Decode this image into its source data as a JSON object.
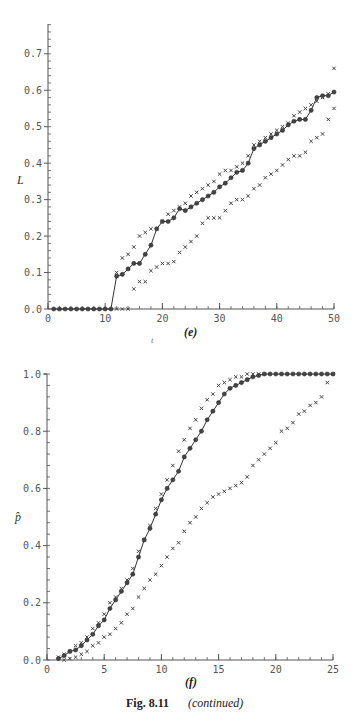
{
  "figure": {
    "label": "Fig. 8.11",
    "continued": "(continued)"
  },
  "chart_data": [
    {
      "type": "line",
      "panel": "(e)",
      "title": "",
      "xlabel": "t",
      "ylabel": "L",
      "xlim": [
        0,
        50
      ],
      "ylim": [
        0,
        0.75
      ],
      "xticks": [
        0,
        10,
        20,
        30,
        40,
        50
      ],
      "yticks": [
        0.0,
        0.1,
        0.2,
        0.3,
        0.4,
        0.5,
        0.6,
        0.7
      ],
      "ytick_labels": [
        "0.0",
        "0.1",
        "0.2",
        "0.3",
        "0.4",
        "0.5",
        "0.6",
        "0.7"
      ],
      "grid": false,
      "legend": null,
      "series": [
        {
          "name": "estimate",
          "marker": "circle",
          "line": true,
          "x": [
            1,
            2,
            3,
            4,
            5,
            6,
            7,
            8,
            9,
            10,
            11,
            12,
            13,
            14,
            15,
            16,
            17,
            18,
            19,
            20,
            21,
            22,
            23,
            24,
            25,
            26,
            27,
            28,
            29,
            30,
            31,
            32,
            33,
            34,
            35,
            36,
            37,
            38,
            39,
            40,
            41,
            42,
            43,
            44,
            45,
            46,
            47,
            48,
            49,
            50
          ],
          "y": [
            0,
            0,
            0,
            0,
            0,
            0,
            0,
            0,
            0,
            0,
            0,
            0.09,
            0.095,
            0.11,
            0.125,
            0.125,
            0.15,
            0.175,
            0.22,
            0.24,
            0.24,
            0.25,
            0.275,
            0.27,
            0.28,
            0.29,
            0.3,
            0.31,
            0.32,
            0.335,
            0.345,
            0.36,
            0.375,
            0.38,
            0.4,
            0.44,
            0.45,
            0.46,
            0.47,
            0.48,
            0.49,
            0.505,
            0.515,
            0.52,
            0.52,
            0.545,
            0.58,
            0.585,
            0.585,
            0.595
          ]
        },
        {
          "name": "upper bound",
          "marker": "x",
          "line": false,
          "x": [
            12,
            13,
            14,
            15,
            16,
            17,
            18,
            19,
            20,
            21,
            22,
            23,
            24,
            25,
            26,
            27,
            28,
            29,
            30,
            31,
            32,
            33,
            34,
            35,
            36,
            37,
            38,
            39,
            40,
            41,
            42,
            43,
            44,
            45,
            46,
            47,
            48,
            49,
            50
          ],
          "y": [
            0.1,
            0.14,
            0.15,
            0.17,
            0.2,
            0.21,
            0.22,
            0.22,
            0.24,
            0.26,
            0.27,
            0.28,
            0.29,
            0.31,
            0.32,
            0.33,
            0.34,
            0.35,
            0.37,
            0.38,
            0.38,
            0.39,
            0.4,
            0.42,
            0.45,
            0.46,
            0.47,
            0.48,
            0.49,
            0.5,
            0.51,
            0.53,
            0.54,
            0.55,
            0.56,
            0.57,
            0.58,
            0.59,
            0.66
          ]
        },
        {
          "name": "lower bound",
          "marker": "x",
          "line": false,
          "x": [
            12,
            13,
            14,
            15,
            16,
            17,
            18,
            19,
            20,
            21,
            22,
            23,
            24,
            25,
            26,
            27,
            28,
            29,
            30,
            31,
            32,
            33,
            34,
            35,
            36,
            37,
            38,
            39,
            40,
            41,
            42,
            43,
            44,
            45,
            46,
            47,
            48,
            49,
            50
          ],
          "y": [
            0,
            0,
            0,
            0.055,
            0.075,
            0.075,
            0.105,
            0.115,
            0.125,
            0.125,
            0.13,
            0.155,
            0.17,
            0.185,
            0.2,
            0.235,
            0.25,
            0.25,
            0.25,
            0.27,
            0.29,
            0.3,
            0.3,
            0.31,
            0.33,
            0.34,
            0.36,
            0.37,
            0.38,
            0.395,
            0.41,
            0.42,
            0.42,
            0.43,
            0.46,
            0.47,
            0.48,
            0.52,
            0.55
          ]
        }
      ]
    },
    {
      "type": "line",
      "panel": "(f)",
      "title": "",
      "xlabel": "",
      "ylabel": "p̂",
      "xlim": [
        0,
        25
      ],
      "ylim": [
        0,
        1.0
      ],
      "xticks": [
        0,
        5,
        10,
        15,
        20,
        25
      ],
      "yticks": [
        0.0,
        0.2,
        0.4,
        0.6,
        0.8,
        1.0
      ],
      "ytick_labels": [
        "0.0",
        "0.2",
        "0.4",
        "0.6",
        "0.8",
        "1.0"
      ],
      "grid": false,
      "legend": null,
      "series": [
        {
          "name": "estimate",
          "marker": "circle",
          "line": true,
          "x": [
            1,
            1.5,
            2,
            2.5,
            3,
            3.5,
            4,
            4.5,
            5,
            5.5,
            6,
            6.5,
            7,
            7.5,
            8,
            8.5,
            9,
            9.5,
            10,
            10.5,
            11,
            11.5,
            12,
            12.5,
            13,
            13.5,
            14,
            14.5,
            15,
            15.5,
            16,
            16.5,
            17,
            17.5,
            18,
            18.5,
            19,
            19.5,
            20,
            20.5,
            21,
            21.5,
            22,
            22.5,
            23,
            23.5,
            24,
            24.5,
            25
          ],
          "y": [
            0.005,
            0.015,
            0.03,
            0.035,
            0.05,
            0.07,
            0.09,
            0.12,
            0.14,
            0.18,
            0.21,
            0.24,
            0.27,
            0.3,
            0.36,
            0.42,
            0.46,
            0.51,
            0.56,
            0.6,
            0.63,
            0.66,
            0.71,
            0.74,
            0.77,
            0.8,
            0.84,
            0.87,
            0.9,
            0.93,
            0.95,
            0.96,
            0.97,
            0.98,
            0.99,
            0.995,
            1.0,
            1.0,
            1.0,
            1.0,
            1.0,
            1.0,
            1.0,
            1.0,
            1.0,
            1.0,
            1.0,
            1.0,
            1.0
          ]
        },
        {
          "name": "upper bound",
          "marker": "x",
          "line": false,
          "x": [
            1,
            1.5,
            2,
            2.5,
            3,
            3.5,
            4,
            4.5,
            5,
            5.5,
            6,
            6.5,
            7,
            7.5,
            8,
            8.5,
            9,
            9.5,
            10,
            10.5,
            11,
            11.5,
            12,
            12.5,
            13,
            13.5,
            14,
            14.5,
            15,
            15.5,
            16,
            16.5,
            17,
            17.5,
            18,
            18.5,
            19
          ],
          "y": [
            0.01,
            0.02,
            0.03,
            0.05,
            0.06,
            0.08,
            0.11,
            0.13,
            0.16,
            0.2,
            0.22,
            0.25,
            0.28,
            0.32,
            0.38,
            0.42,
            0.47,
            0.53,
            0.58,
            0.63,
            0.68,
            0.73,
            0.77,
            0.81,
            0.84,
            0.88,
            0.91,
            0.93,
            0.96,
            0.97,
            0.98,
            0.99,
            0.99,
            1.0,
            1.0,
            1.0,
            1.0
          ]
        },
        {
          "name": "lower bound",
          "marker": "x",
          "line": false,
          "x": [
            1.5,
            2,
            2.5,
            3,
            3.5,
            4,
            4.5,
            5,
            5.5,
            6,
            6.5,
            7,
            7.5,
            8,
            8.5,
            9,
            9.5,
            10,
            10.5,
            11,
            11.5,
            12,
            12.5,
            13,
            13.5,
            14,
            14.5,
            15,
            15.5,
            16,
            16.5,
            17,
            17.5,
            18,
            18.5,
            19,
            19.5,
            20,
            20.5,
            21,
            21.5,
            22,
            22.5,
            23,
            23.5,
            24,
            24.5,
            25
          ],
          "y": [
            0.0,
            0.005,
            0.01,
            0.02,
            0.03,
            0.05,
            0.06,
            0.08,
            0.09,
            0.11,
            0.13,
            0.16,
            0.18,
            0.22,
            0.25,
            0.28,
            0.3,
            0.33,
            0.36,
            0.39,
            0.41,
            0.45,
            0.48,
            0.5,
            0.53,
            0.55,
            0.57,
            0.58,
            0.59,
            0.6,
            0.61,
            0.62,
            0.64,
            0.68,
            0.7,
            0.72,
            0.74,
            0.76,
            0.8,
            0.81,
            0.83,
            0.86,
            0.87,
            0.89,
            0.9,
            0.92,
            0.97,
            1.0
          ]
        }
      ]
    }
  ]
}
